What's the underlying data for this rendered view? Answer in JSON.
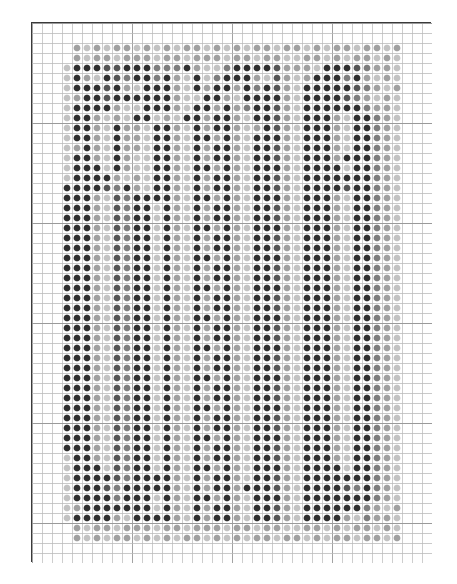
{
  "chart_data": {
    "type": "heatmap",
    "title": "",
    "subtitle": "",
    "xlabel": "",
    "ylabel": "",
    "grid": true,
    "legend_position": "none",
    "geometry": {
      "frame_x": 31,
      "frame_y": 22,
      "frame_width": 400,
      "frame_height": 540,
      "frame_border_color": "#3a3a3a",
      "cell_size": 10,
      "columns": 40,
      "rows": 54,
      "dot_radius": 3.4,
      "grid_line_color": "#b9b9b9",
      "grid_line_width": 0.7,
      "major_grid_line_color": "#9a9a9a",
      "major_every": 10,
      "background": "#ffffff"
    },
    "palette": {
      "0": "#ffffff",
      "1": "#2f2f2f",
      "2": "#555555",
      "3": "#7d7d7d",
      "4": "#a0a0a0",
      "5": "#c2c2c2",
      "6": "#dcdcdc"
    },
    "palette_labels": {
      "0": "empty",
      "1": "very-dark",
      "2": "dark",
      "3": "medium-dark",
      "4": "medium",
      "5": "light",
      "6": "very-light"
    },
    "pattern_origin": {
      "col": 2,
      "row": 1
    },
    "pattern_cols": 36,
    "pattern_rows": 52,
    "rows_data": [
      "000000000000000000000000000000000000",
      "004545445454544545454454454544544540",
      "004544544454454445445445544545445450",
      "051112211133314553111124445111234450",
      "051451231131451531114524541113145450",
      "051112145111451411413124511111234540",
      "054112111111455114511114511112345450",
      "051111455111451141431124511111134450",
      "051145451154511411451124511145113450",
      "051145144511451411454124511145113450",
      "051145144511451141451114511145113450",
      "054145144511451411451124511145113450",
      "051145145511451411451124511141113450",
      "051115145511451141451114511115113450",
      "051111454511451411451124511111113450",
      "011112314511451411451124511112113450",
      "011145231111451141451114511145113450",
      "011145231151451411451124511145113450",
      "011145231151451411451124511145113450",
      "011145231151451141451114511145113450",
      "011145231151451411451124511145113450",
      "011145231151451411451124511145113450",
      "011145231151451141451114511145113450",
      "011145231151451411451124511145113450",
      "011145231151451411451124511145113450",
      "011145231151451141451114511145113450",
      "011145231151451411451124511145113450",
      "011145231151451411451124511145113450",
      "011145231151451141451114511145113450",
      "011145231151451411451124511145113450",
      "011145231151451411451124511145113450",
      "011145231151451141451114511145113450",
      "011145231151451411451124511145113450",
      "011145231151451411451124511145113450",
      "011145231151451141451114511145113450",
      "011145231151451411451124511145113450",
      "011145231151451411451124511145113450",
      "011145231151451141451114511145113450",
      "011145231151451411451124511145113450",
      "011145231151451411451124511145113450",
      "011145231151451141451114511145113450",
      "011145231151451411451124511145113450",
      "051145231151451411451124511145113450",
      "051115231151451141451114511115113450",
      "051111231111451411451124511111113450",
      "051112311111451411411124511112313450",
      "051111311151451141451114511111113450",
      "054111111151451411451124511111134540",
      "051111451111451411451124511114534450",
      "004544544454454445445445544545445450",
      "004545445454544545454454454544544540",
      "000000000000000000000000000000000000"
    ]
  }
}
